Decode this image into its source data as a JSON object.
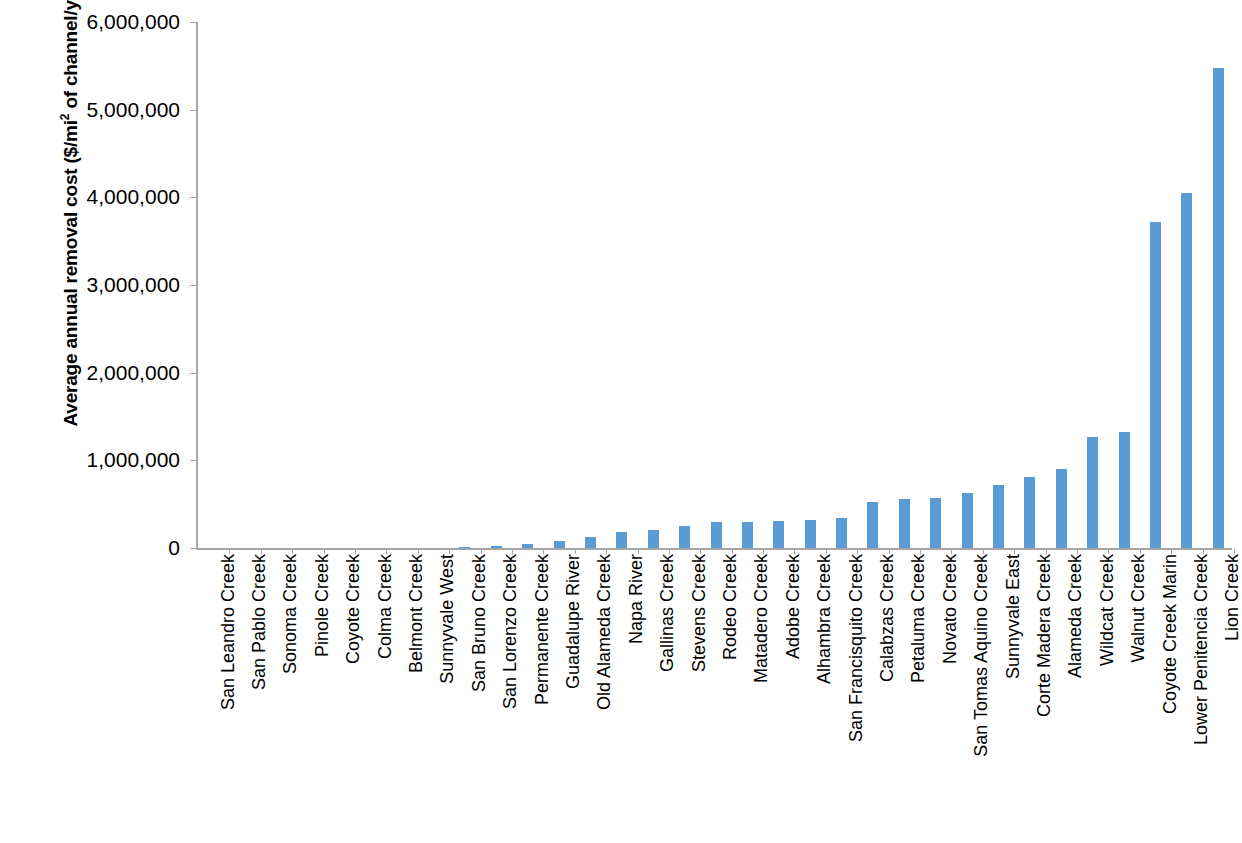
{
  "chart_data": {
    "type": "bar",
    "title": "",
    "subtitle": "",
    "xlabel": "",
    "ylabel": "Average annual removal cost ($/mi2 of channel/yr)",
    "ylabel_parts": {
      "before_sup": "Average annual removal cost ($/mi",
      "sup": "2",
      "after_sup": " of channel/yr)"
    },
    "ylim": [
      0,
      6000000
    ],
    "ytick_values": [
      0,
      1000000,
      2000000,
      3000000,
      4000000,
      5000000,
      6000000
    ],
    "ytick_labels": [
      "0",
      "1,000,000",
      "2,000,000",
      "3,000,000",
      "4,000,000",
      "5,000,000",
      "6,000,000"
    ],
    "grid": false,
    "legend": "none",
    "bar_color": "#5B9BD5",
    "axis_color": "#A6A6A6",
    "categories": [
      "San Leandro Creek",
      "San Pablo Creek",
      "Sonoma Creek",
      "Pinole Creek",
      "Coyote Creek",
      "Colma Creek",
      "Belmont Creek",
      "Sunnyvale West",
      "San Bruno Creek",
      "San Lorenzo Creek",
      "Permanente Creek",
      "Guadalupe River",
      "Old Alameda Creek",
      "Napa River",
      "Gallinas  Creek",
      "Stevens Creek",
      "Rodeo Creek",
      "Matadero Creek",
      "Adobe Creek",
      "Alhambra Creek",
      "San Francisquito Creek",
      "Calabzas Creek",
      "Petaluma Creek",
      "Novato Creek",
      "San Tomas Aquino Creek",
      "Sunnyvale East",
      "Corte Madera Creek",
      "Alameda Creek",
      "Wildcat Creek",
      "Walnut Creek",
      "Coyote Creek Marin",
      "Lower Penitencia Creek",
      "Lion Creek"
    ],
    "values": [
      0,
      0,
      0,
      0,
      0,
      0,
      0,
      0,
      15000,
      25000,
      50000,
      85000,
      125000,
      185000,
      205000,
      255000,
      295000,
      295000,
      310000,
      320000,
      340000,
      525000,
      555000,
      570000,
      625000,
      715000,
      810000,
      900000,
      1265000,
      1320000,
      3720000,
      4050000,
      5470000
    ]
  }
}
